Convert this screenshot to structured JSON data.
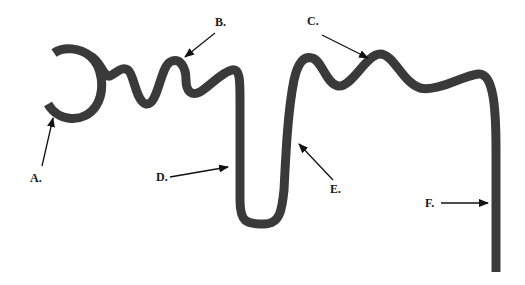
{
  "diagram": {
    "type": "nephron-tubule-labeled",
    "stroke_color": "#3a3a3a",
    "labels": [
      {
        "id": "A",
        "text": "A."
      },
      {
        "id": "B",
        "text": "B."
      },
      {
        "id": "C",
        "text": "C."
      },
      {
        "id": "D",
        "text": "D."
      },
      {
        "id": "E",
        "text": "E."
      },
      {
        "id": "F",
        "text": "F."
      }
    ]
  }
}
